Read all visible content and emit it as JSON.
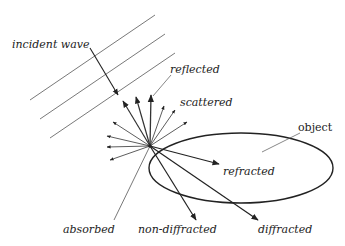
{
  "diagram": {
    "colors": {
      "stroke": "#222222",
      "thin": "#555555",
      "background": "#ffffff"
    },
    "labels": {
      "incident": "incident wave",
      "reflected": "reflected",
      "scattered": "scattered",
      "object": "object",
      "refracted": "refracted",
      "absorbed": "absorbed",
      "non_diffracted": "non-diffracted",
      "diffracted": "diffracted"
    },
    "nodes": [
      {
        "id": "incident-wave",
        "kind": "parallel-wavefronts",
        "count": 3
      },
      {
        "id": "interaction-point",
        "kind": "point"
      },
      {
        "id": "object",
        "kind": "ellipse"
      }
    ],
    "edges": [
      {
        "from": "incident-wave",
        "to": "interaction-point",
        "label": "incident wave"
      },
      {
        "from": "interaction-point",
        "to": "outside",
        "label": "reflected"
      },
      {
        "from": "interaction-point",
        "to": "outside",
        "label": "scattered"
      },
      {
        "from": "interaction-point",
        "to": "object",
        "label": "refracted"
      },
      {
        "from": "interaction-point",
        "to": "object",
        "label": "absorbed"
      },
      {
        "from": "interaction-point",
        "to": "beyond",
        "label": "non-diffracted"
      },
      {
        "from": "interaction-point",
        "to": "beyond",
        "label": "diffracted"
      }
    ]
  }
}
